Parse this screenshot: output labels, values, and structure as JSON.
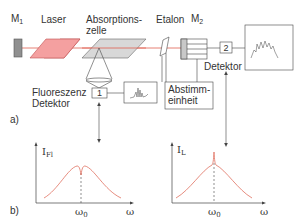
{
  "panel_a": {
    "marker": "a)",
    "labels": {
      "mirror1": "M",
      "mirror1_sub": "1",
      "laser": "Laser",
      "absorption_cell_line1": "Absorptions-",
      "absorption_cell_line2": "zelle",
      "etalon": "Etalon",
      "mirror2": "M",
      "mirror2_sub": "2",
      "detector2": "Detektor",
      "fluorescence_detector_line1": "Fluoreszenz",
      "fluorescence_detector_line2": "Detektor",
      "tuning_unit_line1": "Abstimm-",
      "tuning_unit_line2": "einheit",
      "detector1_number": "1",
      "detector2_number": "2"
    }
  },
  "panel_b": {
    "marker": "b)",
    "plots": [
      {
        "ylabel": "I",
        "ylabel_sub": "Fl",
        "xlabel": "ω",
        "center_label": "ω",
        "center_label_sub": "0",
        "feature": "dip"
      },
      {
        "ylabel": "I",
        "ylabel_sub": "L",
        "xlabel": "ω",
        "center_label": "ω",
        "center_label_sub": "0",
        "feature": "peak"
      }
    ]
  },
  "colors": {
    "beam": "#e06050",
    "laser_fill": "#f4a0a0",
    "cell_fill": "#d8d8d8",
    "mirror_fill": "#909090",
    "curve": "#e07060",
    "line": "#444444"
  }
}
